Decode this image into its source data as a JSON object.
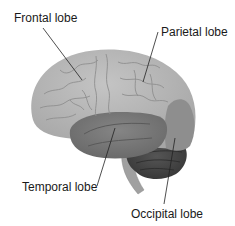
{
  "diagram": {
    "labels": [
      {
        "id": "frontal",
        "text": "Frontal lobe"
      },
      {
        "id": "parietal",
        "text": "Parietal lobe"
      },
      {
        "id": "temporal",
        "text": "Temporal lobe"
      },
      {
        "id": "occipital",
        "text": "Occipital lobe"
      }
    ]
  },
  "colors": {
    "background": "#ffffff",
    "cerebrum_light": "#b4b4b4",
    "temporal": "#7a7a7a",
    "occipital": "#8c8c8c",
    "cerebellum": "#4a4a4a",
    "brainstem": "#9a9a9a",
    "leader_line": "#222222",
    "label_text": "#1a1a1a"
  }
}
